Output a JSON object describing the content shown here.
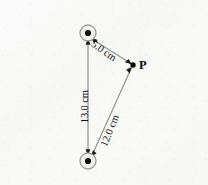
{
  "figure": {
    "type": "geometry-diagram",
    "colors": {
      "background": "#f8f8f7",
      "line": "#8a8a8a",
      "node_stroke": "#9a9a9a",
      "node_fill": "#f0f0ef",
      "dot": "#0a0a0a",
      "text": "#0d0d0d"
    },
    "nodes": [
      {
        "id": "node-top",
        "name": "top-charge-marker",
        "cx": 88,
        "cy": 33,
        "r": 8,
        "dot_r": 3.1
      },
      {
        "id": "node-bottom",
        "name": "bottom-charge-marker",
        "cx": 88,
        "cy": 161,
        "r": 8,
        "dot_r": 3.1
      }
    ],
    "points": [
      {
        "id": "point-p",
        "label": "P",
        "cx": 133,
        "cy": 65,
        "dot_r": 2.6
      }
    ],
    "segments": [
      {
        "id": "seg-top-p",
        "from": "node-top",
        "to": "point-p",
        "label": "5.0 cm",
        "arrowheads": "both"
      },
      {
        "id": "seg-vertical",
        "from": "node-top",
        "to": "node-bottom",
        "label": "13.0 cm",
        "arrowheads": "both"
      },
      {
        "id": "seg-bottom-p",
        "from": "node-bottom",
        "to": "point-p",
        "label": "12.0 cm",
        "arrowheads": "both"
      }
    ],
    "labels": {
      "top_to_p": "5.0 cm",
      "vertical": "13.0 cm",
      "bottom_to_p": "12.0 cm",
      "point_p": "P"
    }
  }
}
